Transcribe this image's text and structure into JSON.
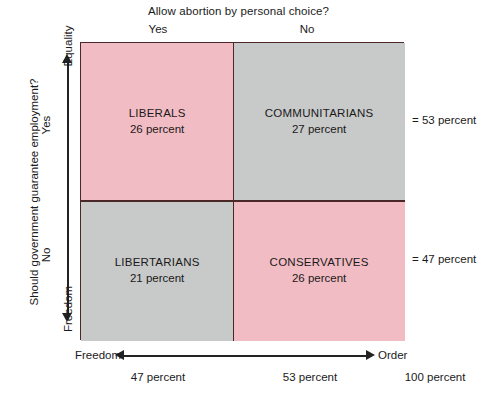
{
  "chart_data": {
    "type": "table",
    "title": "Allow abortion by personal choice?",
    "xlabel": "Allow abortion by personal choice?",
    "ylabel": "Should government guarantee employment?",
    "x_axis_arrow": {
      "left": "Freedom",
      "right": "Order"
    },
    "y_axis_arrow": {
      "top": "Equality",
      "bottom": "Freedom"
    },
    "column_headers": [
      "Yes",
      "No"
    ],
    "row_headers": [
      "Yes",
      "No"
    ],
    "cells": [
      [
        {
          "name": "LIBERALS",
          "value": "26 percent",
          "percent": 26,
          "color": "#f2bcc4"
        },
        {
          "name": "COMMUNITARIANS",
          "value": "27 percent",
          "percent": 27,
          "color": "#c8c9c9"
        }
      ],
      [
        {
          "name": "LIBERTARIANS",
          "value": "21 percent",
          "percent": 21,
          "color": "#c8c9c9"
        },
        {
          "name": "CONSERVATIVES",
          "value": "26 percent",
          "percent": 26,
          "color": "#f2bcc4"
        }
      ]
    ],
    "row_totals": [
      "= 53 percent",
      "= 47 percent"
    ],
    "column_totals": [
      "47 percent",
      "53 percent"
    ],
    "grand_total": "100 percent",
    "grid": true,
    "legend": "none"
  },
  "header": {
    "question": "Allow abortion by personal choice?",
    "col_yes": "Yes",
    "col_no": "No"
  },
  "side": {
    "question": "Should government guarantee employment?",
    "row_yes": "Yes",
    "row_no": "No"
  },
  "vertical_axis": {
    "top_label": "Equality",
    "bottom_label": "Freedom"
  },
  "horizontal_axis": {
    "left_label": "Freedom",
    "right_label": "Order"
  },
  "quadrants": {
    "liberals": {
      "name": "LIBERALS",
      "value": "26 percent"
    },
    "communitarians": {
      "name": "COMMUNITARIANS",
      "value": "27 percent"
    },
    "libertarians": {
      "name": "LIBERTARIANS",
      "value": "21 percent"
    },
    "conservatives": {
      "name": "CONSERVATIVES",
      "value": "26 percent"
    }
  },
  "totals": {
    "row_top": "= 53 percent",
    "row_bottom": "= 47 percent",
    "col_left": "47 percent",
    "col_right": "53 percent",
    "grand": "100 percent"
  },
  "colors": {
    "pink": "#f2bcc4",
    "gray": "#c8c9c9",
    "border": "#4a2828",
    "axis": "#232323",
    "text": "#1a1a1a"
  }
}
